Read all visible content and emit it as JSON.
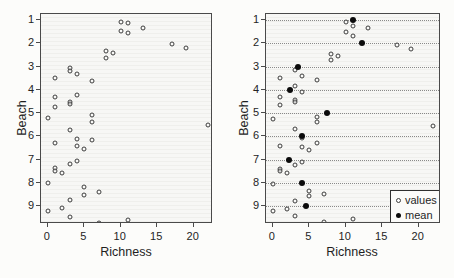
{
  "figure": {
    "bg_color": "#fcfcfa",
    "panel_bg_color": "#f6f6f3",
    "frame_color": "#4a4a4a",
    "point_ring_color": "#3d3d3d",
    "mean_point_color": "#0b0b0b",
    "gridline_color": "#777777",
    "text_color": "#1f1f1f"
  },
  "chart_data": [
    {
      "type": "scatter",
      "panel": "left",
      "title": "",
      "xlabel": "Richness",
      "ylabel": "Beach",
      "x_ticks": [
        0,
        5,
        10,
        15,
        20
      ],
      "y_ticks": [
        1,
        2,
        3,
        4,
        5,
        6,
        7,
        8,
        9
      ],
      "xlim": [
        -0.92,
        22.64
      ],
      "ylim": [
        0.74,
        9.76
      ],
      "y_axis_reversed": true,
      "grid": false,
      "beach_values": {
        "1": [
          10,
          11,
          13,
          10,
          11
        ],
        "2": [
          17,
          19,
          8,
          9,
          8
        ],
        "3": [
          3,
          3,
          4,
          1,
          6
        ],
        "4": [
          4,
          1,
          3,
          3,
          1
        ],
        "5": [
          6,
          0,
          6,
          22,
          3
        ],
        "6": [
          4,
          6,
          1,
          4,
          5
        ],
        "7": [
          4,
          3,
          1,
          1,
          2
        ],
        "8": [
          0,
          5,
          7,
          5,
          3
        ],
        "9": [
          2,
          0,
          3,
          11,
          7
        ]
      },
      "series": [
        {
          "name": "values",
          "marker": "open-circle",
          "points": [
            [
              10,
              1.07
            ],
            [
              11,
              1.13
            ],
            [
              13,
              1.35
            ],
            [
              10,
              1.48
            ],
            [
              11,
              1.57
            ],
            [
              17,
              2.05
            ],
            [
              19,
              2.22
            ],
            [
              8,
              2.35
            ],
            [
              9,
              2.43
            ],
            [
              8,
              2.62
            ],
            [
              3,
              3.06
            ],
            [
              3,
              3.17
            ],
            [
              4,
              3.31
            ],
            [
              1,
              3.5
            ],
            [
              6,
              3.61
            ],
            [
              4,
              4.23
            ],
            [
              1,
              4.31
            ],
            [
              3,
              4.52
            ],
            [
              3,
              4.62
            ],
            [
              1,
              4.73
            ],
            [
              6,
              5.08
            ],
            [
              0,
              5.22
            ],
            [
              6,
              5.4
            ],
            [
              22,
              5.52
            ],
            [
              3,
              5.73
            ],
            [
              4,
              6.09
            ],
            [
              6,
              6.17
            ],
            [
              1,
              6.27
            ],
            [
              4,
              6.43
            ],
            [
              5,
              6.52
            ],
            [
              4,
              7.04
            ],
            [
              3,
              7.2
            ],
            [
              1,
              7.36
            ],
            [
              1,
              7.47
            ],
            [
              2,
              7.57
            ],
            [
              0,
              8.0
            ],
            [
              5,
              8.17
            ],
            [
              7,
              8.38
            ],
            [
              5,
              8.5
            ],
            [
              3,
              8.72
            ],
            [
              2,
              9.06
            ],
            [
              0,
              9.19
            ],
            [
              3,
              9.45
            ],
            [
              11,
              9.58
            ],
            [
              7,
              9.7
            ]
          ]
        }
      ]
    },
    {
      "type": "scatter",
      "panel": "right",
      "title": "",
      "xlabel": "Richness",
      "ylabel": "Beach",
      "x_ticks": [
        0,
        5,
        10,
        15,
        20
      ],
      "y_ticks": [
        1,
        2,
        3,
        4,
        5,
        6,
        7,
        8,
        9
      ],
      "xlim": [
        -0.92,
        23.05
      ],
      "ylim": [
        0.74,
        9.76
      ],
      "y_axis_reversed": true,
      "grid": true,
      "grid_horizontal_at": [
        1,
        2,
        3,
        4,
        5,
        6,
        7,
        8,
        9
      ],
      "grid_style": "dotted",
      "beach_values": {
        "1": [
          10,
          11,
          13,
          10,
          11
        ],
        "2": [
          17,
          19,
          8,
          9,
          8
        ],
        "3": [
          3,
          3,
          4,
          1,
          6
        ],
        "4": [
          4,
          1,
          3,
          3,
          1
        ],
        "5": [
          6,
          0,
          6,
          22,
          3
        ],
        "6": [
          4,
          6,
          1,
          4,
          5
        ],
        "7": [
          4,
          3,
          1,
          1,
          2
        ],
        "8": [
          0,
          5,
          7,
          5,
          3
        ],
        "9": [
          2,
          0,
          3,
          11,
          7
        ]
      },
      "beach_means": {
        "1": 11.0,
        "2": 12.2,
        "3": 3.4,
        "4": 2.4,
        "5": 7.4,
        "6": 4.0,
        "7": 2.2,
        "8": 4.0,
        "9": 4.6
      },
      "series": [
        {
          "name": "values",
          "marker": "open-circle",
          "points": [
            [
              10,
              1.09
            ],
            [
              11,
              1.26
            ],
            [
              13,
              1.36
            ],
            [
              10,
              1.53
            ],
            [
              11,
              1.7
            ],
            [
              17,
              2.09
            ],
            [
              19,
              2.25
            ],
            [
              8,
              2.46
            ],
            [
              9,
              2.54
            ],
            [
              8,
              2.7
            ],
            [
              3,
              3.15
            ],
            [
              4,
              3.4
            ],
            [
              1,
              3.5
            ],
            [
              6,
              3.57
            ],
            [
              3,
              3.83
            ],
            [
              4,
              4.07
            ],
            [
              1,
              4.3
            ],
            [
              3,
              4.43
            ],
            [
              3,
              4.53
            ],
            [
              1,
              4.66
            ],
            [
              6,
              5.15
            ],
            [
              0,
              5.27
            ],
            [
              6,
              5.4
            ],
            [
              22,
              5.57
            ],
            [
              3,
              5.67
            ],
            [
              4,
              6.07
            ],
            [
              6,
              6.28
            ],
            [
              1,
              6.4
            ],
            [
              4,
              6.47
            ],
            [
              5,
              6.6
            ],
            [
              4,
              7.08
            ],
            [
              3,
              7.22
            ],
            [
              1,
              7.38
            ],
            [
              1,
              7.48
            ],
            [
              2,
              7.58
            ],
            [
              0,
              8.05
            ],
            [
              5,
              8.35
            ],
            [
              7,
              8.45
            ],
            [
              5,
              8.55
            ],
            [
              3,
              8.78
            ],
            [
              2,
              9.1
            ],
            [
              0,
              9.22
            ],
            [
              3,
              9.4
            ],
            [
              11,
              9.55
            ],
            [
              7,
              9.67
            ]
          ]
        },
        {
          "name": "mean",
          "marker": "filled-circle",
          "points": [
            [
              11,
              1
            ],
            [
              12.2,
              2
            ],
            [
              3.4,
              3
            ],
            [
              2.4,
              4
            ],
            [
              7.4,
              5
            ],
            [
              4.0,
              6
            ],
            [
              2.2,
              7
            ],
            [
              4.0,
              8
            ],
            [
              4.6,
              9
            ]
          ]
        }
      ],
      "legend": {
        "position": "bottom-right",
        "items": [
          {
            "marker": "open-circle",
            "label": "values"
          },
          {
            "marker": "filled-circle",
            "label": "mean"
          }
        ]
      }
    }
  ]
}
